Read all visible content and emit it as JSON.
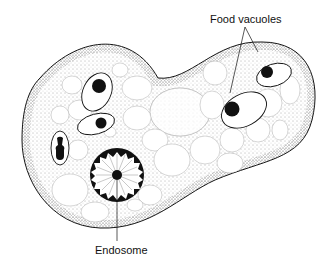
{
  "figure": {
    "labels": {
      "food_vacuoles": "Food vacuoles",
      "endosome": "Endosome"
    },
    "colors": {
      "ink": "#111111",
      "background": "#ffffff",
      "stipple": "#555555"
    },
    "structures": [
      {
        "name": "cell-membrane",
        "type": "outline"
      },
      {
        "name": "nucleus",
        "type": "circle",
        "center": [
          117,
          175
        ],
        "radius": 27
      },
      {
        "name": "endosome",
        "type": "dot",
        "center": [
          117,
          175
        ]
      },
      {
        "name": "food-vacuole",
        "count": 5
      }
    ]
  }
}
